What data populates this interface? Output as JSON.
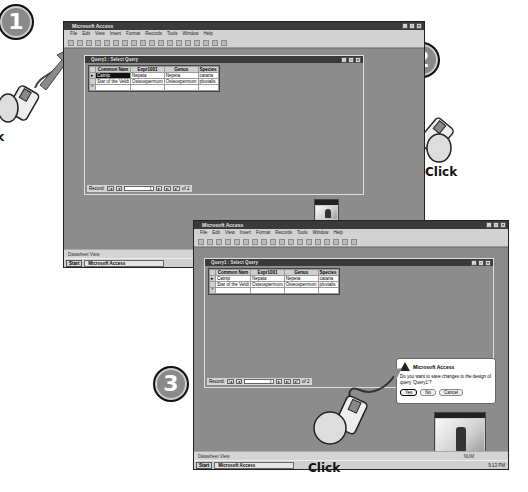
{
  "steps": [
    {
      "number": "1",
      "label": "Click"
    },
    {
      "number": "2",
      "label": "Click"
    },
    {
      "number": "3",
      "label": "Click"
    }
  ],
  "app": {
    "title": "Microsoft Access",
    "menu": [
      "File",
      "Edit",
      "View",
      "Insert",
      "Format",
      "Records",
      "Tools",
      "Window",
      "Help"
    ],
    "status": "Datasheet View",
    "num_indicator": "NUM",
    "clock": "9:13 PM"
  },
  "taskbar": {
    "start_label": "Start",
    "task_label": "Microsoft Access"
  },
  "query_window": {
    "title": "Query1 : Select Query",
    "columns": [
      "Common Nam",
      "Expr1001",
      "Genus",
      "Species"
    ],
    "rows": [
      [
        "Catnip",
        "Nepata",
        "Nepeta",
        "cataria"
      ],
      [
        "Star of the Veldt",
        "Osteospermum",
        "Osteospermum",
        "pluvialis"
      ]
    ],
    "record_label": "Record:",
    "record_current": "1",
    "record_total": "of 2"
  },
  "dialog": {
    "title": "Microsoft Access",
    "message": "Do you want to save changes to the design of query 'Query1'?",
    "buttons": {
      "yes": "Yes",
      "no": "No",
      "cancel": "Cancel"
    }
  },
  "colors": {
    "titlebar": "#3a3a3a",
    "workspace": "#8c8c8c",
    "chrome": "#d2d2d2"
  }
}
